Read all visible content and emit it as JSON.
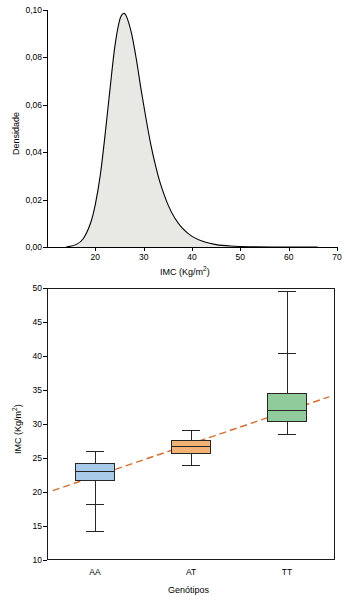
{
  "chart_data": [
    {
      "type": "area",
      "title": "",
      "xlabel": "IMC (Kg/m2)",
      "xlabel_base": "IMC (Kg/m",
      "xlabel_sup": "2",
      "xlabel_tail": ")",
      "ylabel": "Densidade",
      "xlim": [
        10,
        70
      ],
      "ylim": [
        0,
        0.1
      ],
      "xticks": [
        20,
        30,
        40,
        50,
        60,
        70
      ],
      "xtick_labels": [
        "20",
        "30",
        "40",
        "50",
        "60",
        "70"
      ],
      "yticks": [
        0.0,
        0.02,
        0.04,
        0.06,
        0.08,
        0.1
      ],
      "ytick_labels": [
        "0,00",
        "0,02",
        "0,04",
        "0,06",
        "0,08",
        "0,10"
      ],
      "grid": false,
      "legend": "none",
      "fill_color": "#e8e8e4",
      "line_color": "#000000",
      "curve_points": [
        [
          14.0,
          0.0
        ],
        [
          16.0,
          0.001
        ],
        [
          17.5,
          0.0035
        ],
        [
          19.0,
          0.01
        ],
        [
          20.0,
          0.018
        ],
        [
          21.0,
          0.03
        ],
        [
          22.0,
          0.047
        ],
        [
          23.0,
          0.066
        ],
        [
          24.0,
          0.084
        ],
        [
          25.0,
          0.0955
        ],
        [
          25.8,
          0.0985
        ],
        [
          26.5,
          0.097
        ],
        [
          27.5,
          0.09
        ],
        [
          28.5,
          0.079
        ],
        [
          29.5,
          0.066
        ],
        [
          30.5,
          0.054
        ],
        [
          31.5,
          0.043
        ],
        [
          32.5,
          0.034
        ],
        [
          33.5,
          0.0265
        ],
        [
          35.0,
          0.018
        ],
        [
          36.5,
          0.012
        ],
        [
          38.0,
          0.008
        ],
        [
          40.0,
          0.0045
        ],
        [
          42.5,
          0.0022
        ],
        [
          45.0,
          0.001
        ],
        [
          48.0,
          0.0004
        ],
        [
          52.0,
          0.0001
        ],
        [
          58.0,
          0.0
        ],
        [
          66.0,
          0.0
        ]
      ]
    },
    {
      "type": "box",
      "title": "",
      "xlabel": "Genótipos",
      "ylabel": "IMC (Kg/m2)",
      "ylabel_base": "IMC (Kg/m",
      "ylabel_sup": "2",
      "ylabel_tail": ")",
      "ylim": [
        10,
        50
      ],
      "yticks": [
        10,
        15,
        20,
        25,
        30,
        35,
        40,
        45,
        50
      ],
      "ytick_labels": [
        "10",
        "15",
        "20",
        "25",
        "30",
        "35",
        "40",
        "45",
        "50"
      ],
      "categories": [
        "AA",
        "AT",
        "TT"
      ],
      "grid": false,
      "legend": "none",
      "trendline": {
        "color": "#e06a2b",
        "style": "dashed",
        "x_start_frac": 0.02,
        "y_start": 20.2,
        "x_end_frac": 0.98,
        "y_end": 34.0
      },
      "boxes": [
        {
          "category": "AA",
          "color": "#a9c9e8",
          "whisker_low": 14.3,
          "q1": 21.6,
          "median": 23.1,
          "q3": 24.3,
          "whisker_high": 26.1,
          "lower_inner_cap": 18.2
        },
        {
          "category": "AT",
          "color": "#f3b275",
          "whisker_low": 24.0,
          "q1": 25.6,
          "median": 26.8,
          "q3": 27.6,
          "whisker_high": 29.1
        },
        {
          "category": "TT",
          "color": "#8fcb9b",
          "whisker_low": 28.6,
          "q1": 30.3,
          "median": 32.1,
          "q3": 34.5,
          "whisker_high": 49.6,
          "upper_inner_cap": 40.4
        }
      ]
    }
  ]
}
